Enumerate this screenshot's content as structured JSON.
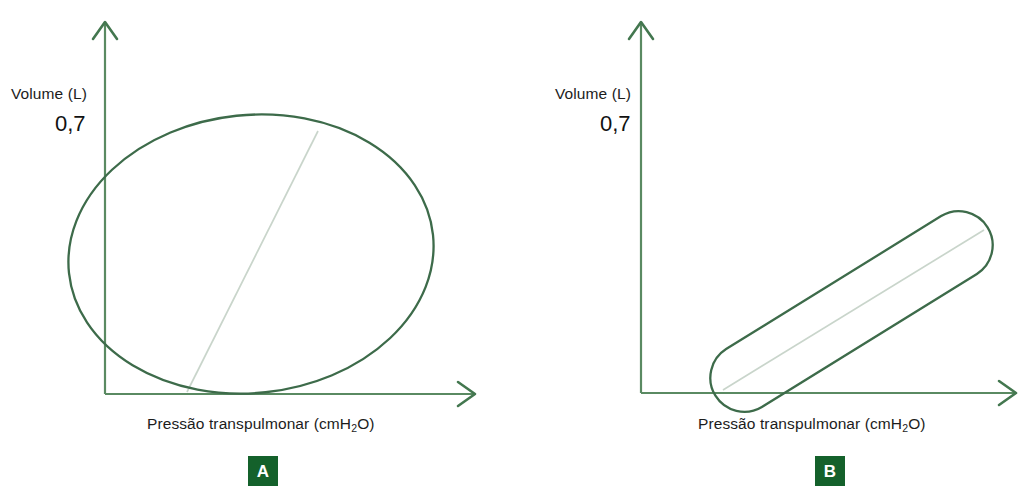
{
  "figure": {
    "background": "#ffffff",
    "curve_color": "#3d6b4a",
    "axis_color": "#5a8a62",
    "faint_line_color": "#cdd8cf",
    "badge_color": "#14612b",
    "badge_text_color": "#ffffff",
    "text_color": "#1c1c1c"
  },
  "panels": [
    {
      "id": "A",
      "badge_label": "A",
      "y_axis_label": "Volume (L)",
      "y_axis_value": "0,7",
      "x_axis_label_main": "Pressão transpulmonar (cmH",
      "x_axis_label_sub": "2",
      "x_axis_label_tail": "O)",
      "shape": "ellipse-hysteresis-loop"
    },
    {
      "id": "B",
      "badge_label": "B",
      "y_axis_label": "Volume (L)",
      "y_axis_value": "0,7",
      "x_axis_label_main": "Pressão transpulmonar (cmH",
      "x_axis_label_sub": "2",
      "x_axis_label_tail": "O)",
      "shape": "narrow-capsule-hysteresis-loop"
    }
  ],
  "chart_data": [
    {
      "type": "line",
      "title": "A",
      "xlabel": "Pressão transpulmonar (cmH2O)",
      "ylabel": "Volume (L)",
      "ytick_labels": [
        "0,7"
      ],
      "xtick_labels": [],
      "grid": false,
      "legend": "none",
      "annotations": [
        "A"
      ],
      "series": [
        {
          "name": "Alça de histerese (laço amplo)",
          "description": "Large wide ellipse loop, tilted slightly, spanning nearly full plot width and reaching the 0,7 volume level",
          "shape": "ellipse",
          "center": [
            251,
            254
          ],
          "rx": 183,
          "ry": 139,
          "rotation_deg": -6
        },
        {
          "name": "Linha de complacência (tracejado claro)",
          "description": "Faint straight compliance line through the loop",
          "shape": "line",
          "points": [
            [
              187,
              392
            ],
            [
              318,
              131
            ]
          ]
        }
      ]
    },
    {
      "type": "line",
      "title": "B",
      "xlabel": "Pressão transpulmonar (cmH2O)",
      "ylabel": "Volume (L)",
      "ytick_labels": [
        "0,7"
      ],
      "xtick_labels": [],
      "grid": false,
      "legend": "none",
      "annotations": [
        "B"
      ],
      "series": [
        {
          "name": "Alça de histerese (laço estreito)",
          "description": "Narrow elongated capsule (stadium) loop tilted about 40 degrees, much smaller volume excursion",
          "shape": "capsule",
          "start": [
            744,
            378
          ],
          "end": [
            959,
            245
          ],
          "half_width": 34
        },
        {
          "name": "Linha de complacência (tracejado claro)",
          "description": "Faint straight compliance line along the capsule axis",
          "shape": "line",
          "points": [
            [
              723,
              390
            ],
            [
              984,
              230
            ]
          ]
        }
      ]
    }
  ]
}
